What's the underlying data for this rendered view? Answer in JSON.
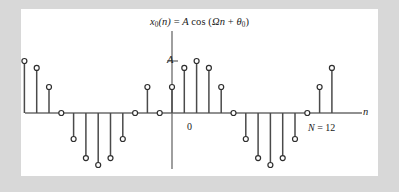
{
  "figure": {
    "title_parts": {
      "x": "x",
      "x_sub": "0",
      "arg": "(n)",
      "equals": "=",
      "amplitude": "A",
      "cos": "cos",
      "open": "(",
      "omega": "Ω",
      "n": "n",
      "plus": "+",
      "theta": "θ",
      "theta_sub": "0",
      "close": ")"
    },
    "title_plain": "x₀(n) = A cos (Ωn + θ₀)",
    "axis_labels": {
      "x_axis": "n",
      "y_amplitude": "A",
      "origin": "0"
    },
    "annotation": {
      "period_symbol": "N",
      "period_equals": "=",
      "period_value": "12",
      "period_text": "N = 12"
    },
    "colors": {
      "stem_line": "#4a4a4a",
      "marker_stroke": "#2e2e2e",
      "marker_fill": "#ffffff",
      "axis": "#6b6b6b",
      "text": "#1a1a1a",
      "panel_background": "#ffffff",
      "frame_background": "#d8d8d8"
    }
  },
  "chart_data": {
    "type": "scatter",
    "plot_style": "stem",
    "xlabel": "n",
    "ylabel": "A",
    "grid": false,
    "legend": null,
    "period_N": 12,
    "omega": "2π/12",
    "theta0": "-π/3",
    "amplitude_label": "A",
    "xlim": [
      -14,
      14
    ],
    "ylim": [
      -1.08,
      1.08
    ],
    "x": [
      -13,
      -12,
      -11,
      -10,
      -9,
      -8,
      -7,
      -6,
      -5,
      -4,
      -3,
      -2,
      -1,
      0,
      1,
      2,
      3,
      4,
      5,
      6,
      7,
      8,
      9,
      10,
      11,
      12,
      13
    ],
    "values": [
      0.866,
      1.0,
      0.866,
      0.5,
      0.0,
      -0.5,
      -0.866,
      -1.0,
      -0.866,
      -0.5,
      0.0,
      0.5,
      0.0,
      0.5,
      0.866,
      1.0,
      0.866,
      0.5,
      0.0,
      -0.5,
      -0.866,
      -1.0,
      -0.866,
      -0.5,
      0.0,
      0.5,
      0.866
    ],
    "y": [
      0.866,
      1.0,
      0.866,
      0.5,
      0.0,
      -0.5,
      -0.866,
      -1.0,
      -0.866,
      -0.5,
      0.0,
      0.5,
      0.0,
      0.5,
      0.866,
      1.0,
      0.866,
      0.5,
      0.0,
      -0.5,
      -0.866,
      -1.0,
      -0.866,
      -0.5,
      0.0,
      0.5,
      0.866
    ]
  }
}
